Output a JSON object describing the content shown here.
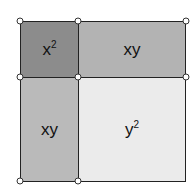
{
  "diagram": {
    "title": "",
    "cells": [
      {
        "id": "x2",
        "base": "x",
        "sup": "2",
        "color": "#8c8c8c"
      },
      {
        "id": "xy-top",
        "base": "xy",
        "sup": "",
        "color": "#b3b3b3"
      },
      {
        "id": "xy-left",
        "base": "xy",
        "sup": "",
        "color": "#bababa"
      },
      {
        "id": "y2",
        "base": "y",
        "sup": "2",
        "color": "#ebebeb"
      }
    ]
  }
}
